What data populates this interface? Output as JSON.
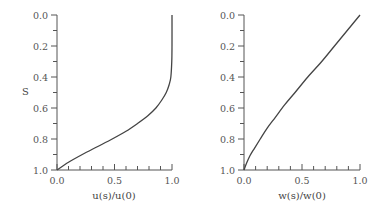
{
  "chart_data": [
    {
      "type": "line",
      "title": "",
      "xlabel": "u(s)/u(0)",
      "ylabel": "S",
      "xlim": [
        0.0,
        1.0
      ],
      "ylim": [
        1.0,
        0.0
      ],
      "y_inverted": true,
      "grid": false,
      "x_ticks": [
        "0.0",
        "0.5",
        "1.0"
      ],
      "y_ticks": [
        "0.0",
        "0.2",
        "0.4",
        "0.6",
        "0.8",
        "1.0"
      ],
      "series": [
        {
          "name": "u(s)/u(0)",
          "x": [
            1.0,
            1.0,
            0.998,
            0.99,
            0.975,
            0.95,
            0.91,
            0.86,
            0.79,
            0.7,
            0.6,
            0.48,
            0.35,
            0.22,
            0.1,
            0.0
          ],
          "y": [
            0.0,
            0.2,
            0.3,
            0.4,
            0.45,
            0.5,
            0.55,
            0.6,
            0.65,
            0.7,
            0.75,
            0.8,
            0.85,
            0.9,
            0.95,
            1.0
          ]
        }
      ]
    },
    {
      "type": "line",
      "title": "",
      "xlabel": "w(s)/w(0)",
      "ylabel": "",
      "xlim": [
        0.0,
        1.0
      ],
      "ylim": [
        1.0,
        0.0
      ],
      "y_inverted": true,
      "grid": false,
      "x_ticks": [
        "0.0",
        "0.5",
        "1.0"
      ],
      "y_ticks": [
        "0.0",
        "0.2",
        "0.4",
        "0.6",
        "0.8",
        "1.0"
      ],
      "series": [
        {
          "name": "w(s)/w(0)",
          "x": [
            1.0,
            0.89,
            0.78,
            0.67,
            0.55,
            0.44,
            0.35,
            0.27,
            0.2,
            0.14,
            0.09,
            0.05,
            0.02,
            0.0
          ],
          "y": [
            0.0,
            0.1,
            0.2,
            0.3,
            0.4,
            0.5,
            0.58,
            0.66,
            0.73,
            0.8,
            0.86,
            0.91,
            0.96,
            1.0
          ]
        }
      ]
    }
  ],
  "left_chart": {
    "xlabel": "u(s)/u(0)",
    "ylabel": "S",
    "x_tick_labels": [
      "0.0",
      "0.5",
      "1.0"
    ],
    "y_tick_labels": [
      "0.0",
      "0.2",
      "0.4",
      "0.6",
      "0.8",
      "1.0"
    ]
  },
  "right_chart": {
    "xlabel": "w(s)/w(0)",
    "x_tick_labels": [
      "0.0",
      "0.5",
      "1.0"
    ],
    "y_tick_labels": [
      "0.0",
      "0.2",
      "0.4",
      "0.6",
      "0.8",
      "1.0"
    ]
  },
  "colors": {
    "axis": "#555555",
    "curve": "#444444",
    "text": "#555555"
  }
}
